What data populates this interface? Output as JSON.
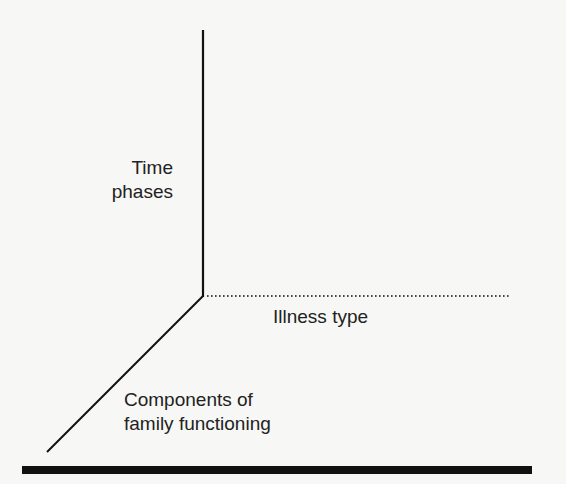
{
  "diagram": {
    "type": "three-dimensional axis model",
    "axes": [
      {
        "id": "vertical",
        "label_lines": [
          "Time",
          "phases"
        ],
        "style": "solid"
      },
      {
        "id": "horizontal",
        "label": "Illness type",
        "style": "dotted"
      },
      {
        "id": "diagonal",
        "label_lines": [
          "Components of",
          "family functioning"
        ],
        "style": "solid"
      }
    ],
    "colors": {
      "line": "#111111",
      "text": "#222222",
      "background": "#f7f7f5"
    }
  },
  "labels": {
    "time_line1": "Time",
    "time_line2": "phases",
    "illness": "Illness type",
    "components_line1": "Components of",
    "components_line2": "family functioning"
  }
}
